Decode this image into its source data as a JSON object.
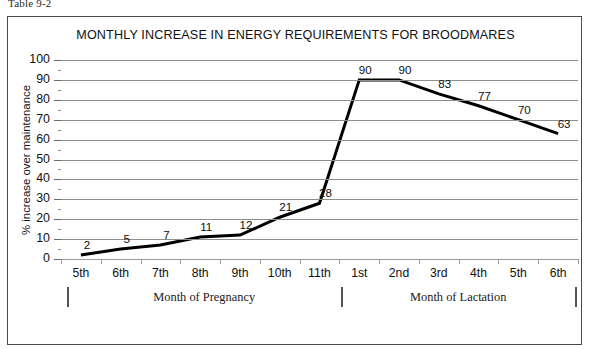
{
  "caption": "Table 9-2",
  "chart_data": {
    "type": "line",
    "title": "MONTHLY INCREASE IN ENERGY REQUIREMENTS FOR BROODMARES",
    "xlabel": "",
    "ylabel": "% increase over maintenance",
    "categories": [
      "5th",
      "6th",
      "7th",
      "8th",
      "9th",
      "10th",
      "11th",
      "1st",
      "2nd",
      "3rd",
      "4th",
      "5th",
      "6th"
    ],
    "values": [
      2,
      5,
      7,
      11,
      12,
      21,
      28,
      90,
      90,
      83,
      77,
      70,
      63
    ],
    "data_labels": [
      "2",
      "5",
      "7",
      "11",
      "12",
      "21",
      "28",
      "90",
      "90",
      "83",
      "77",
      "70",
      "63"
    ],
    "ylim": [
      0,
      100
    ],
    "ytick_labels": [
      "100",
      "90",
      "80",
      "70",
      "60",
      "50",
      "40",
      "30",
      "20",
      "10",
      "0"
    ],
    "ytick_values": [
      100,
      90,
      80,
      70,
      60,
      50,
      40,
      30,
      20,
      10,
      0
    ],
    "yminor_step": 5,
    "grid": true,
    "legend": "none",
    "line_color": "#000000",
    "grid_color": "#8e8e8e",
    "axis_groups": [
      {
        "label": "Month of Pregnancy",
        "from": 0,
        "to": 6
      },
      {
        "label": "Month of Lactation",
        "from": 7,
        "to": 12
      }
    ]
  }
}
